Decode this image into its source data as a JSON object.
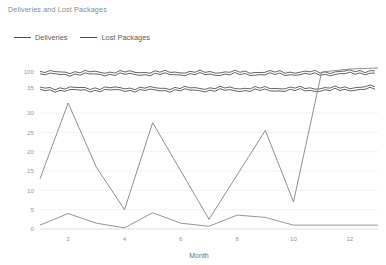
{
  "chart_title": "Deliveries and Lost Packages",
  "legend": {
    "position": "top-left",
    "items": [
      {
        "label": "Deliveries",
        "color": "#4a4a4a"
      },
      {
        "label": "Lost Packages",
        "color": "#4a4a4a"
      }
    ]
  },
  "axis": {
    "xlabel": "Month",
    "ylabel": "",
    "x_ticks": [
      "2",
      "4",
      "6",
      "8",
      "10",
      "12"
    ],
    "y_ticks": [
      "0",
      "5",
      "10",
      "15",
      "20",
      "25",
      "30",
      "35",
      "100"
    ]
  },
  "chart_data": {
    "type": "line",
    "title": "Deliveries and Lost Packages",
    "xlabel": "Month",
    "ylabel": "",
    "x": [
      1,
      2,
      3,
      4,
      5,
      6,
      7,
      8,
      9,
      10,
      11,
      12,
      13
    ],
    "x_tick_labels": [
      "2",
      "4",
      "6",
      "8",
      "10",
      "12"
    ],
    "y_tick_labels": [
      "0",
      "5",
      "10",
      "15",
      "20",
      "25",
      "30",
      "35",
      "100"
    ],
    "ylim": [
      0,
      100
    ],
    "broken_axis": true,
    "broken_axis_note": "Lower band 0-30 linear with ticks every 5; compressed upper ticks at 35 and 100",
    "grid": true,
    "grid_axis": "y",
    "legend_position": "top-left",
    "series": [
      {
        "name": "Deliveries",
        "color": "#4a4a4a",
        "style": "noisy-flat-band",
        "values": [
          100,
          100,
          100,
          100,
          100,
          100,
          100,
          100,
          100,
          100,
          101,
          101,
          101
        ],
        "secondary_band_values": [
          35,
          35,
          35,
          35,
          35,
          35,
          35,
          35,
          35,
          35,
          36,
          36,
          36
        ]
      },
      {
        "name": "Lost Packages",
        "color": "#8a8a8a",
        "style": "zigzag",
        "values": [
          13,
          32,
          16,
          5,
          27.5,
          15,
          2.5,
          14,
          25.5,
          7,
          100,
          112,
          118
        ]
      },
      {
        "name": "Lost Packages (low)",
        "color": "#8a8a8a",
        "style": "flat-low",
        "values": [
          1,
          4,
          1.5,
          0.3,
          4.2,
          1.5,
          0.7,
          3.6,
          3,
          1,
          1,
          1,
          1
        ]
      }
    ]
  }
}
